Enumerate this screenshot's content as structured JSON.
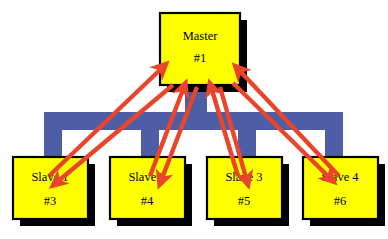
{
  "diagram": {
    "type": "master-slave-bus-topology",
    "background_color": "#FFFFFF",
    "palette": {
      "node_fill": "#FFFF00",
      "node_border": "#000000",
      "node_shadow": "#000000",
      "bus_color": "#4E5EA6",
      "arrow_color": "#E8452B",
      "arrow_highlight": "#F4apple",
      "text_color": "#000000"
    },
    "master": {
      "label": "Master",
      "id_label": "#1",
      "x": 160,
      "y": 13,
      "w": 80,
      "h": 72
    },
    "slaves": [
      {
        "label": "Slave 1",
        "id_label": "#3",
        "x": 13,
        "y": 157,
        "w": 75,
        "h": 62
      },
      {
        "label": "Slave 2",
        "id_label": "#4",
        "x": 110,
        "y": 157,
        "w": 75,
        "h": 62
      },
      {
        "label": "Slave 3",
        "id_label": "#5",
        "x": 207,
        "y": 157,
        "w": 75,
        "h": 62
      },
      {
        "label": "Slave 4",
        "id_label": "#6",
        "x": 303,
        "y": 157,
        "w": 75,
        "h": 62
      }
    ],
    "bus": {
      "stem": {
        "x": 185,
        "y": 85,
        "w": 22,
        "h": 30
      },
      "rail": {
        "x": 44,
        "y": 112,
        "w": 299,
        "h": 18
      },
      "legs": [
        {
          "x": 44,
          "y": 130,
          "w": 18,
          "h": 30
        },
        {
          "x": 141,
          "y": 130,
          "w": 18,
          "h": 30
        },
        {
          "x": 238,
          "y": 130,
          "w": 18,
          "h": 30
        },
        {
          "x": 325,
          "y": 130,
          "w": 18,
          "h": 30
        }
      ]
    },
    "arrows": [
      {
        "name": "slave1-to-master",
        "from": [
          52,
          172
        ],
        "to": [
          166,
          68
        ],
        "direction": "up"
      },
      {
        "name": "master-to-slave1",
        "from": [
          174,
          84
        ],
        "to": [
          58,
          180
        ],
        "direction": "down"
      },
      {
        "name": "slave2-to-master",
        "from": [
          152,
          172
        ],
        "to": [
          186,
          86
        ],
        "direction": "up"
      },
      {
        "name": "master-to-slave2",
        "from": [
          196,
          86
        ],
        "to": [
          160,
          178
        ],
        "direction": "down"
      },
      {
        "name": "slave3-to-master",
        "from": [
          236,
          172
        ],
        "to": [
          210,
          86
        ],
        "direction": "up"
      },
      {
        "name": "master-to-slave3",
        "from": [
          219,
          86
        ],
        "to": [
          245,
          178
        ],
        "direction": "down"
      },
      {
        "name": "slave4-to-master",
        "from": [
          340,
          172
        ],
        "to": [
          236,
          70
        ],
        "direction": "up"
      },
      {
        "name": "master-to-slave4",
        "from": [
          232,
          82
        ],
        "to": [
          332,
          176
        ],
        "direction": "down"
      }
    ]
  }
}
